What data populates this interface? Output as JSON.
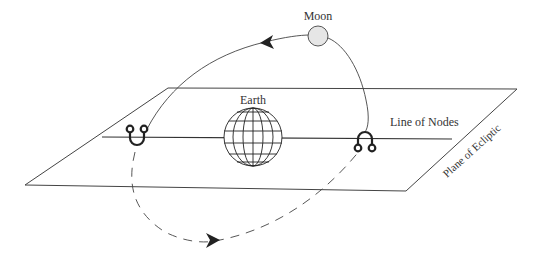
{
  "diagram": {
    "type": "lunar-orbit-nodes",
    "labels": {
      "moon": "Moon",
      "earth": "Earth",
      "line_of_nodes": "Line of Nodes",
      "plane_of_ecliptic": "Plane of Ecliptic"
    },
    "symbols": {
      "descending_node": "descending-node-symbol",
      "ascending_node": "ascending-node-symbol"
    },
    "colors": {
      "line": "#333333",
      "moon_fill": "#e6e6e6",
      "background": "#ffffff"
    }
  }
}
